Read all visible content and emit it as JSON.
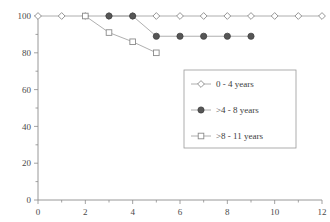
{
  "chart_data": {
    "type": "line",
    "title": "",
    "subtitle": "",
    "xlabel": "",
    "ylabel": "",
    "xlim": [
      0,
      12
    ],
    "ylim": [
      0,
      100
    ],
    "grid": false,
    "legend_position": "center-right",
    "x_ticks": [
      0,
      2,
      4,
      6,
      8,
      10,
      12
    ],
    "x_tick_labels": [
      "0",
      "2",
      "4",
      "6",
      "8",
      "10",
      "12"
    ],
    "x_minor_ticks": [
      1,
      3,
      5,
      7,
      9,
      11
    ],
    "y_ticks": [
      0,
      20,
      40,
      60,
      80,
      100
    ],
    "y_tick_labels": [
      "0",
      "20",
      "40",
      "60",
      "80",
      "100"
    ],
    "y_minor_ticks": [
      10,
      30,
      50,
      70,
      90
    ],
    "series": [
      {
        "name": "0 - 4 years",
        "marker": "open-diamond",
        "x": [
          0,
          1,
          2,
          3,
          4,
          5,
          6,
          7,
          8,
          9,
          10,
          11,
          12
        ],
        "values": [
          100,
          100,
          100,
          100,
          100,
          100,
          100,
          100,
          100,
          100,
          100,
          100,
          100
        ]
      },
      {
        "name": ">4 - 8 years",
        "marker": "filled-circle",
        "x": [
          3,
          4,
          5,
          6,
          7,
          8,
          9
        ],
        "values": [
          100,
          100,
          89,
          89,
          89,
          89,
          89
        ]
      },
      {
        "name": ">8 - 11 years",
        "marker": "open-square",
        "x": [
          2,
          3,
          4,
          5
        ],
        "values": [
          100,
          91,
          86,
          80
        ]
      }
    ]
  },
  "legend": {
    "entries": [
      {
        "label": "0 - 4 years",
        "marker": "open-diamond"
      },
      {
        "label": ">4 - 8 years",
        "marker": "filled-circle"
      },
      {
        "label": ">8 - 11 years",
        "marker": "open-square"
      }
    ]
  },
  "colors": {
    "axis": "#8c8c8c",
    "line": "#9a9a9a",
    "marker_fill_open": "#ffffff",
    "marker_fill_solid": "#565656",
    "marker_stroke": "#8a8a8a",
    "text": "#4a4a4a",
    "background": "#ffffff"
  }
}
